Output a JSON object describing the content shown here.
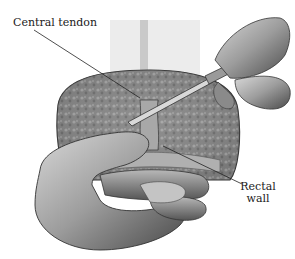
{
  "figure": {
    "labels": [
      {
        "id": "central-tendon",
        "text": "Central tendon"
      },
      {
        "id": "rectal-wall",
        "line1": "Rectal",
        "line2": "wall"
      }
    ]
  }
}
